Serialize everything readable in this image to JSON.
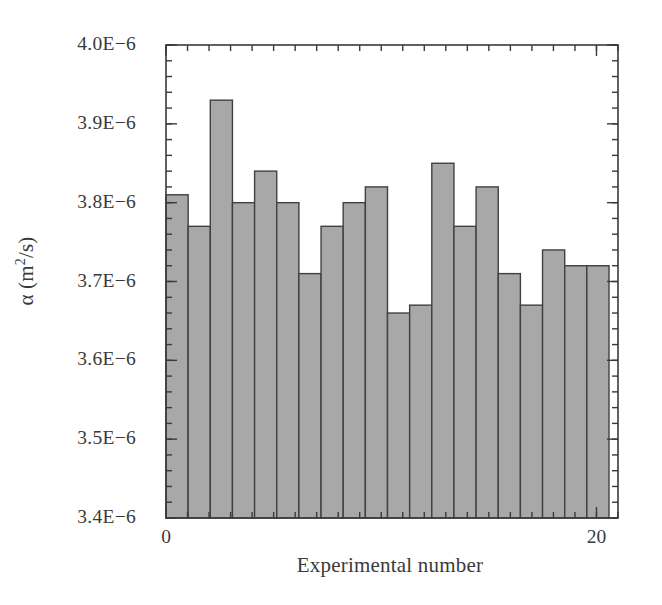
{
  "chart_data": {
    "type": "bar",
    "title": "",
    "subtitle": "",
    "xlabel": "Experimental number",
    "ylabel": "α (m²/s)",
    "ylabel_parts": {
      "symbol": "α",
      "open": " (m",
      "exponent": "2",
      "close": "/s)"
    },
    "x": [
      1,
      2,
      3,
      4,
      5,
      6,
      7,
      8,
      9,
      10,
      11,
      12,
      13,
      14,
      15,
      16,
      17,
      18,
      19,
      20
    ],
    "categories": [
      "1",
      "2",
      "3",
      "4",
      "5",
      "6",
      "7",
      "8",
      "9",
      "10",
      "11",
      "12",
      "13",
      "14",
      "15",
      "16",
      "17",
      "18",
      "19",
      "20"
    ],
    "values": [
      3.81e-06,
      3.77e-06,
      3.93e-06,
      3.8e-06,
      3.84e-06,
      3.8e-06,
      3.71e-06,
      3.77e-06,
      3.8e-06,
      3.82e-06,
      3.66e-06,
      3.67e-06,
      3.85e-06,
      3.77e-06,
      3.82e-06,
      3.71e-06,
      3.67e-06,
      3.74e-06,
      3.72e-06,
      3.72e-06
    ],
    "ylim": [
      3.4e-06,
      4e-06
    ],
    "xlim": [
      0,
      21
    ],
    "ytick_values": [
      3.4e-06,
      3.5e-06,
      3.6e-06,
      3.7e-06,
      3.8e-06,
      3.9e-06,
      4e-06
    ],
    "ytick_labels": [
      "3.4E−6",
      "3.5E−6",
      "3.6E−6",
      "3.7E−6",
      "3.8E−6",
      "3.9E−6",
      "4.0E−6"
    ],
    "yminor_step": 2e-08,
    "xtick_values": [
      0,
      20
    ],
    "xtick_labels": [
      "0",
      "20"
    ],
    "xminor_step": 1,
    "grid": false,
    "legend": null,
    "bar_fill": "#a8a8a8",
    "bar_edge": "#404040",
    "axis_color": "#3a3a3a",
    "bar_width_frac": 1.0,
    "frame": "full"
  }
}
